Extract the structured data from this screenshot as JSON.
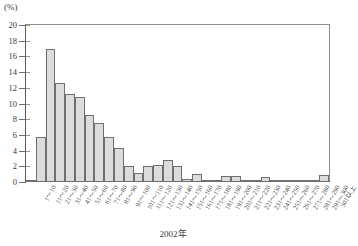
{
  "chart_data": {
    "type": "bar",
    "title": "",
    "subtitle": "",
    "unit_label": "(%)",
    "xlabel": "2002年",
    "ylabel": "",
    "ylim": [
      0,
      20
    ],
    "ytick_step": 2,
    "grid": false,
    "legend": null,
    "categories": [
      "1～10",
      "11～20",
      "21～30",
      "31～40",
      "41～50",
      "51～60",
      "61～70",
      "71～80",
      "81～90",
      "91～100",
      "101～110",
      "111～120",
      "121～130",
      "131～140",
      "141～150",
      "151～160",
      "161～170",
      "171～180",
      "181～190",
      "191～200",
      "201～210",
      "211～220",
      "221～230",
      "231～240",
      "241～250",
      "251～260",
      "261～270",
      "271～280",
      "281～290",
      "291～300",
      "301以上"
    ],
    "values": [
      0.3,
      5.7,
      17.0,
      12.6,
      11.2,
      10.8,
      8.5,
      7.5,
      5.7,
      4.3,
      2.1,
      1.2,
      2.0,
      2.2,
      2.8,
      2.0,
      0.4,
      1.0,
      0.3,
      0.3,
      0.8,
      0.8,
      0.2,
      0.2,
      0.6,
      0.2,
      0.15,
      0.15,
      0.15,
      0.15,
      0.9
    ],
    "ytick_labels": [
      "0",
      "2",
      "4",
      "6",
      "8",
      "10",
      "12",
      "14",
      "16",
      "18",
      "20"
    ],
    "ytick_values": [
      0,
      2,
      4,
      6,
      8,
      10,
      12,
      14,
      16,
      18,
      20
    ],
    "colors": {
      "bar_fill": "#dcdcdc",
      "bar_stroke": "#6f6f6f",
      "axis": "#5a5a5a",
      "text": "#3a3a3a"
    }
  },
  "caption": {
    "text": "2002年"
  }
}
